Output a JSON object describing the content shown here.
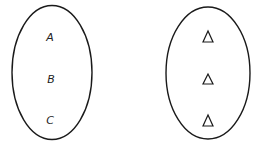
{
  "diagram": {
    "type": "set-mapping",
    "sets": [
      {
        "name": "left-set",
        "shape": "ellipse",
        "elements": [
          "A",
          "B",
          "C"
        ]
      },
      {
        "name": "right-set",
        "shape": "ellipse",
        "elements": [
          "triangle",
          "triangle",
          "triangle"
        ]
      }
    ],
    "colors": {
      "stroke": "#1a1a1a",
      "background": "#ffffff"
    }
  }
}
